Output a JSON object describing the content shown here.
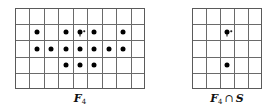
{
  "figure": {
    "panels": [
      {
        "id": "F4",
        "label": {
          "main": "F",
          "sub": "4",
          "op": "",
          "rest": ""
        },
        "grid": {
          "cols": 9,
          "rows": 5,
          "x": 15,
          "y": 8,
          "width": 130,
          "height": 81
        },
        "dots": [
          {
            "col": 1,
            "row": 1
          },
          {
            "col": 3,
            "row": 1
          },
          {
            "col": 4,
            "row": 1,
            "special": true
          },
          {
            "col": 5,
            "row": 1
          },
          {
            "col": 7,
            "row": 1
          },
          {
            "col": 1,
            "row": 2
          },
          {
            "col": 2,
            "row": 2
          },
          {
            "col": 3,
            "row": 2
          },
          {
            "col": 4,
            "row": 2
          },
          {
            "col": 5,
            "row": 2
          },
          {
            "col": 6,
            "row": 2
          },
          {
            "col": 7,
            "row": 2
          },
          {
            "col": 3,
            "row": 3
          },
          {
            "col": 4,
            "row": 3
          },
          {
            "col": 5,
            "row": 3
          }
        ]
      },
      {
        "id": "F4capS",
        "label": {
          "main": "F",
          "sub": "4",
          "op": "∩",
          "rest": "S"
        },
        "grid": {
          "cols": 5,
          "rows": 5,
          "x": 192,
          "y": 8,
          "width": 70,
          "height": 81
        },
        "dots": [
          {
            "col": 2,
            "row": 1,
            "special": true
          },
          {
            "col": 2,
            "row": 3
          }
        ]
      }
    ],
    "colors": {
      "grid_line": "#6a6a6a",
      "dot": "#000000",
      "background": "#ffffff"
    }
  }
}
